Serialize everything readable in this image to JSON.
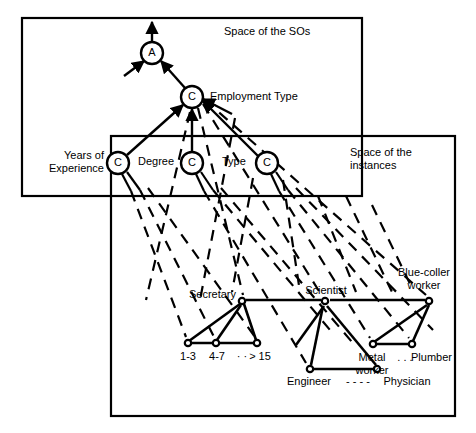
{
  "figure": {
    "line_color": "#000000",
    "background": "#ffffff"
  },
  "boxes": {
    "so_space": {
      "label": "Space of the SOs",
      "x": 22,
      "y": 18,
      "w": 340,
      "h": 178
    },
    "instance_space": {
      "label_line1": "Space of the",
      "label_line2": "instances",
      "x": 111,
      "y": 136,
      "w": 344,
      "h": 280
    }
  },
  "so_nodes": [
    {
      "id": "A",
      "glyph": "A",
      "cx": 152,
      "cy": 53,
      "r": 11,
      "label": ""
    },
    {
      "id": "employment_type",
      "glyph": "C",
      "cx": 192,
      "cy": 97,
      "r": 11,
      "label": "Employment Type"
    },
    {
      "id": "years_of_experience",
      "glyph": "C",
      "cx": 118,
      "cy": 163,
      "r": 11,
      "label_line1": "Years of",
      "label_line2": "Experience"
    },
    {
      "id": "degree",
      "glyph": "C",
      "cx": 192,
      "cy": 163,
      "r": 11,
      "label": "Degree"
    },
    {
      "id": "type",
      "glyph": "C",
      "cx": 267,
      "cy": 163,
      "r": 11,
      "label": "Type"
    }
  ],
  "instance_nodes": [
    {
      "id": "secretary",
      "label": "Secretary",
      "cx": 242,
      "cy": 301
    },
    {
      "id": "scientist",
      "label": "Scientist",
      "cx": 325,
      "cy": 302
    },
    {
      "id": "blue_collar",
      "label_line1": "Blue-coller",
      "label_line2": "worker",
      "cx": 429,
      "cy": 301
    },
    {
      "id": "range_1_3",
      "label": "1-3",
      "cx": 188,
      "cy": 343
    },
    {
      "id": "range_4_7",
      "label": "4-7",
      "cx": 216,
      "cy": 343
    },
    {
      "id": "range_gt15",
      "label": "> 15",
      "cx": 257,
      "cy": 343
    },
    {
      "id": "engineer",
      "label": "Engineer",
      "cx": 310,
      "cy": 369
    },
    {
      "id": "physician",
      "label": "Physician",
      "cx": 377,
      "cy": 369
    },
    {
      "id": "metal_worker",
      "label_line1": "Metal",
      "label_line2": "worker",
      "cx": 373,
      "cy": 344
    },
    {
      "id": "plumber",
      "label": "Plumber",
      "cx": 412,
      "cy": 344
    }
  ],
  "ellipses": [
    {
      "id": "years-ellipsis",
      "text": "· ·"
    },
    {
      "id": "engineer-physician-ellipsis",
      "text": "- - - -"
    },
    {
      "id": "metal-plumber-ellipsis",
      "text": ". . ."
    }
  ],
  "labels": {
    "space_of_sos": "Space of the SOs",
    "space_of_instances_line1": "Space of the",
    "space_of_instances_line2": "instances",
    "employment_type": "Employment Type",
    "years_of_experience_line1": "Years of",
    "years_of_experience_line2": "Experience",
    "degree": "Degree",
    "type": "Type",
    "secretary": "Secretary",
    "scientist": "Scientist",
    "blue_coller_line1": "Blue-coller",
    "blue_coller_line2": "worker",
    "range_1_3": "1-3",
    "range_4_7": "4-7",
    "range_gt_15": "> 15",
    "dots_small": "· ·",
    "engineer": "Engineer",
    "physician": "Physician",
    "dashes_mid": "- - - -",
    "metal_line1": "Metal",
    "metal_line2": "worker",
    "dots_mid": ". . .",
    "plumber": "Plumber",
    "node_a": "A",
    "node_c": "C"
  }
}
